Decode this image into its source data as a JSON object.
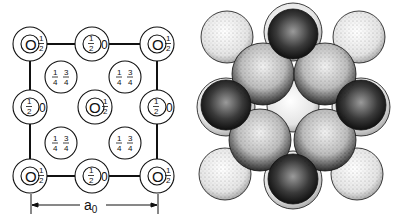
{
  "left_diagram": {
    "description": "Projection of unit cell with fractional heights",
    "lattice_sites": [
      {
        "pos": "top-left",
        "label_main": "0",
        "label_frac": "1/2"
      },
      {
        "pos": "top-mid",
        "label_main": "1/2",
        "label_frac": "0"
      },
      {
        "pos": "top-right",
        "label_main": "0",
        "label_frac": "1/2"
      },
      {
        "pos": "mid-left",
        "label_main": "1/2",
        "label_frac": "0"
      },
      {
        "pos": "center",
        "label_main": "0",
        "label_frac": "1/2"
      },
      {
        "pos": "mid-right",
        "label_main": "1/2",
        "label_frac": "0"
      },
      {
        "pos": "bottom-left",
        "label_main": "0",
        "label_frac": "1/2"
      },
      {
        "pos": "bottom-mid",
        "label_main": "1/2",
        "label_frac": "0"
      },
      {
        "pos": "bottom-right",
        "label_main": "0",
        "label_frac": "1/2"
      }
    ],
    "interstitial_sites": [
      {
        "pos": "upper-left",
        "labels": [
          "1/4",
          "3/4"
        ]
      },
      {
        "pos": "upper-right",
        "labels": [
          "1/4",
          "3/4"
        ]
      },
      {
        "pos": "lower-left",
        "labels": [
          "1/4",
          "3/4"
        ]
      },
      {
        "pos": "lower-right",
        "labels": [
          "1/4",
          "3/4"
        ]
      }
    ],
    "dimension_label": "a",
    "dimension_subscript": "0"
  },
  "right_diagram": {
    "description": "Sphere-packing model of unit cell",
    "sphere_colors": {
      "light": "#e8e8e8",
      "medium": "#9a9a9a",
      "dark": "#1a1a1a"
    }
  }
}
